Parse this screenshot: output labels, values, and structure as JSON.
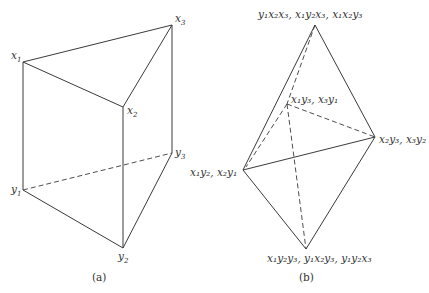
{
  "figure_a": {
    "caption": "(a)",
    "vertices": {
      "x1": {
        "base": "x",
        "sub": "1"
      },
      "x2": {
        "base": "x",
        "sub": "2"
      },
      "x3": {
        "base": "x",
        "sub": "3"
      },
      "y1": {
        "base": "y",
        "sub": "1"
      },
      "y2": {
        "base": "y",
        "sub": "2"
      },
      "y3": {
        "base": "y",
        "sub": "3"
      }
    },
    "solid_edges": [
      [
        "x1",
        "x3"
      ],
      [
        "x1",
        "x2"
      ],
      [
        "x2",
        "x3"
      ],
      [
        "x1",
        "y1"
      ],
      [
        "x2",
        "y2"
      ],
      [
        "x3",
        "y3"
      ],
      [
        "y1",
        "y2"
      ],
      [
        "y2",
        "y3"
      ]
    ],
    "dashed_edges": [
      [
        "y1",
        "y3"
      ]
    ]
  },
  "figure_b": {
    "caption": "(b)",
    "labels": {
      "top": "y₁x₂x₃, x₁y₂x₃, x₁x₂y₃",
      "mid": "x₁y₃, x₃y₁",
      "right": "x₂y₃, x₃y₂",
      "left": "x₁y₂, x₂y₁",
      "bottom": "x₁y₂y₃, y₁x₂y₃, y₁y₂x₃"
    },
    "solid_edges": [
      [
        "top",
        "left"
      ],
      [
        "top",
        "right"
      ],
      [
        "left",
        "right"
      ],
      [
        "left",
        "bottom"
      ],
      [
        "right",
        "bottom"
      ]
    ],
    "dashed_edges": [
      [
        "top",
        "mid"
      ],
      [
        "mid",
        "right"
      ],
      [
        "mid",
        "bottom"
      ],
      [
        "mid",
        "left"
      ]
    ]
  }
}
